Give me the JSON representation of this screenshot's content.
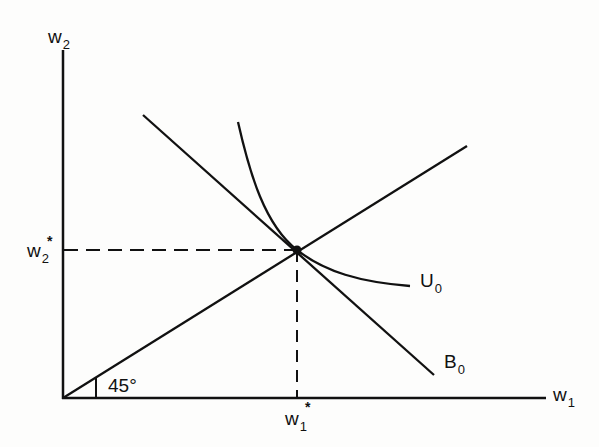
{
  "diagram": {
    "type": "economics-indifference-budget",
    "axes": {
      "x": {
        "label": "w",
        "subscript": "1"
      },
      "y": {
        "label": "w",
        "subscript": "2"
      }
    },
    "equilibrium": {
      "x_label": {
        "label": "w",
        "subscript": "1",
        "superscript": "*"
      },
      "y_label": {
        "label": "w",
        "subscript": "2",
        "superscript": "*"
      }
    },
    "curves": {
      "indifference": {
        "label": "U",
        "subscript": "0"
      },
      "budget": {
        "label": "B",
        "subscript": "0"
      }
    },
    "angle_label": "45°",
    "colors": {
      "ink": "#111111",
      "background": "#fdfdfc"
    }
  }
}
